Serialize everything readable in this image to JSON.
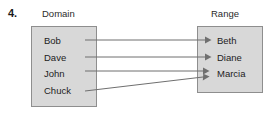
{
  "exercise": {
    "number": "4."
  },
  "diagram": {
    "type": "mapping-diagram",
    "domain": {
      "header": "Domain",
      "members": [
        "Bob",
        "Dave",
        "John",
        "Chuck"
      ]
    },
    "range": {
      "header": "Range",
      "members": [
        "Beth",
        "Diane",
        "Marcia"
      ]
    },
    "mappings": [
      {
        "from": "Bob",
        "to": "Beth"
      },
      {
        "from": "Dave",
        "to": "Diane"
      },
      {
        "from": "John",
        "to": "Marcia"
      },
      {
        "from": "Chuck",
        "to": "Marcia"
      }
    ],
    "colors": {
      "box_fill": "#d8d8d8",
      "box_border": "#8e8e8e",
      "arrow": "#6f6f6f",
      "text": "#1d1d1d",
      "background": "#ffffff"
    }
  }
}
